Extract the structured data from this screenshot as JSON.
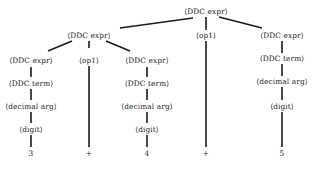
{
  "diagram": {
    "type": "parse-tree",
    "nodes": [
      {
        "id": "root",
        "label": "⟨DDC expr⟩",
        "x": 206,
        "y": 12
      },
      {
        "id": "l1a",
        "label": "⟨DDC expr⟩",
        "x": 89,
        "y": 36
      },
      {
        "id": "l1b",
        "label": "⟨op1⟩",
        "x": 206,
        "y": 36
      },
      {
        "id": "l1c",
        "label": "⟨DDC expr⟩",
        "x": 282,
        "y": 36
      },
      {
        "id": "l2a",
        "label": "⟨DDC expr⟩",
        "x": 31,
        "y": 61
      },
      {
        "id": "l2b",
        "label": "⟨op1⟩",
        "x": 89,
        "y": 61
      },
      {
        "id": "l2c",
        "label": "⟨DDC expr⟩",
        "x": 147,
        "y": 61
      },
      {
        "id": "l2d",
        "label": "⟨DDC term⟩",
        "x": 282,
        "y": 59
      },
      {
        "id": "l3a",
        "label": "⟨DDC term⟩",
        "x": 31,
        "y": 84
      },
      {
        "id": "l3c",
        "label": "⟨DDC term⟩",
        "x": 147,
        "y": 84
      },
      {
        "id": "l3d",
        "label": "⟨decimal arg⟩",
        "x": 282,
        "y": 82
      },
      {
        "id": "l4a",
        "label": "⟨decimal arg⟩",
        "x": 31,
        "y": 107
      },
      {
        "id": "l4c",
        "label": "⟨decimal arg⟩",
        "x": 147,
        "y": 107
      },
      {
        "id": "l4d",
        "label": "⟨digit⟩",
        "x": 282,
        "y": 107
      },
      {
        "id": "l5a",
        "label": "⟨digit⟩",
        "x": 31,
        "y": 130
      },
      {
        "id": "l5c",
        "label": "⟨digit⟩",
        "x": 147,
        "y": 130
      },
      {
        "id": "t1",
        "label": "3",
        "x": 31,
        "y": 154
      },
      {
        "id": "t2",
        "label": "+",
        "x": 89,
        "y": 154
      },
      {
        "id": "t3",
        "label": "4",
        "x": 147,
        "y": 154
      },
      {
        "id": "t4",
        "label": "+",
        "x": 206,
        "y": 154
      },
      {
        "id": "t5",
        "label": "5",
        "x": 282,
        "y": 154
      }
    ],
    "edges": [
      {
        "x1": 193,
        "y1": 18,
        "x2": 120,
        "y2": 28
      },
      {
        "x1": 206,
        "y1": 17,
        "x2": 206,
        "y2": 30
      },
      {
        "x1": 219,
        "y1": 17,
        "x2": 262,
        "y2": 28
      },
      {
        "x1": 72,
        "y1": 41,
        "x2": 48,
        "y2": 51
      },
      {
        "x1": 89,
        "y1": 41,
        "x2": 89,
        "y2": 48
      },
      {
        "x1": 106,
        "y1": 41,
        "x2": 130,
        "y2": 51
      },
      {
        "x1": 206,
        "y1": 41,
        "x2": 206,
        "y2": 147
      },
      {
        "x1": 282,
        "y1": 41,
        "x2": 282,
        "y2": 53
      },
      {
        "x1": 31,
        "y1": 67,
        "x2": 31,
        "y2": 77
      },
      {
        "x1": 89,
        "y1": 66,
        "x2": 89,
        "y2": 147
      },
      {
        "x1": 147,
        "y1": 67,
        "x2": 147,
        "y2": 77
      },
      {
        "x1": 282,
        "y1": 64,
        "x2": 282,
        "y2": 76
      },
      {
        "x1": 31,
        "y1": 89,
        "x2": 31,
        "y2": 100
      },
      {
        "x1": 147,
        "y1": 89,
        "x2": 147,
        "y2": 100
      },
      {
        "x1": 282,
        "y1": 87,
        "x2": 282,
        "y2": 100
      },
      {
        "x1": 31,
        "y1": 112,
        "x2": 31,
        "y2": 123
      },
      {
        "x1": 147,
        "y1": 112,
        "x2": 147,
        "y2": 123
      },
      {
        "x1": 282,
        "y1": 112,
        "x2": 282,
        "y2": 147
      },
      {
        "x1": 31,
        "y1": 135,
        "x2": 31,
        "y2": 147
      },
      {
        "x1": 147,
        "y1": 135,
        "x2": 147,
        "y2": 147
      }
    ]
  }
}
